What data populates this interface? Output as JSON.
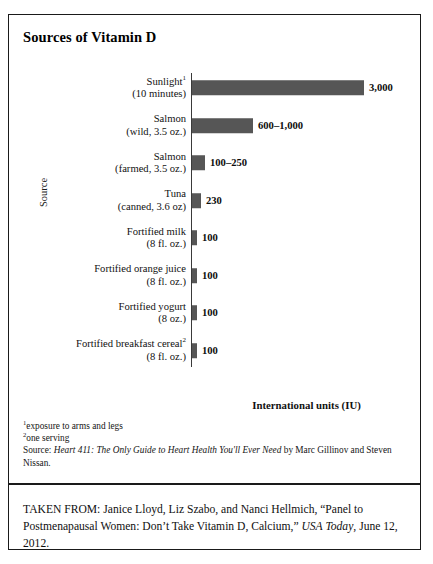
{
  "figure": {
    "title": "Sources of Vitamin D",
    "axis_title_y": "Source",
    "axis_title_x": "International units (IU)"
  },
  "chart_data": {
    "type": "bar",
    "orientation": "horizontal",
    "title": "Sources of Vitamin D",
    "xlabel": "International units (IU)",
    "ylabel": "Source",
    "grid": false,
    "legend": false,
    "xlim": [
      0,
      3300
    ],
    "categories": [
      "Sunlight¹ (10 minutes)",
      "Salmon (wild, 3.5 oz.)",
      "Salmon (farmed, 3.5 oz.)",
      "Tuna (canned, 3.6 oz)",
      "Fortified milk (8 fl. oz.)",
      "Fortified orange juice (8 fl. oz.)",
      "Fortified yogurt (8 oz.)",
      "Fortified breakfast cereal² (8 fl. oz.)"
    ],
    "values": [
      3000,
      1000,
      250,
      230,
      100,
      100,
      100,
      100
    ],
    "value_labels": [
      "3,000",
      "600–1,000",
      "100–250",
      "230",
      "100",
      "100",
      "100",
      "100"
    ],
    "bar_color": "#565656"
  },
  "bars": [
    {
      "label_line1": "Sunlight",
      "label_sup": "1",
      "label_line2": "(10 minutes)",
      "value_label": "3,000",
      "value": 3000,
      "bar_px": 172
    },
    {
      "label_line1": "Salmon",
      "label_sup": "",
      "label_line2": "(wild, 3.5 oz.)",
      "value_label": "600–1,000",
      "value": 1000,
      "bar_px": 61
    },
    {
      "label_line1": "Salmon",
      "label_sup": "",
      "label_line2": "(farmed, 3.5 oz.)",
      "value_label": "100–250",
      "value": 250,
      "bar_px": 13
    },
    {
      "label_line1": "Tuna",
      "label_sup": "",
      "label_line2": "(canned, 3.6 oz)",
      "value_label": "230",
      "value": 230,
      "bar_px": 9
    },
    {
      "label_line1": "Fortified milk",
      "label_sup": "",
      "label_line2": "(8 fl. oz.)",
      "value_label": "100",
      "value": 100,
      "bar_px": 5
    },
    {
      "label_line1": "Fortified orange juice",
      "label_sup": "",
      "label_line2": "(8 fl. oz.)",
      "value_label": "100",
      "value": 100,
      "bar_px": 5
    },
    {
      "label_line1": "Fortified yogurt",
      "label_sup": "",
      "label_line2": "(8 oz.)",
      "value_label": "100",
      "value": 100,
      "bar_px": 5
    },
    {
      "label_line1": "Fortified breakfast cereal",
      "label_sup": "2",
      "label_line2": "(8 fl. oz.)",
      "value_label": "100",
      "value": 100,
      "bar_px": 5
    }
  ],
  "notes": {
    "footnote1_sup": "1",
    "footnote1": "exposure to arms and legs",
    "footnote2_sup": "2",
    "footnote2": "one serving",
    "source_prefix": "Source: ",
    "source_title": "Heart 411: The Only Guide to Heart Health You'll Ever Need",
    "source_suffix": " by Marc Gillinov and Steven Nissan."
  },
  "taken_from": {
    "prefix": "TAKEN FROM: Janice Lloyd, Liz Szabo, and Nanci Hellmich, “Panel to Postmenapausal Women: Don’t Take Vitamin D, Calcium,” ",
    "publication": "USA Today",
    "suffix": ", June 12, 2012."
  }
}
